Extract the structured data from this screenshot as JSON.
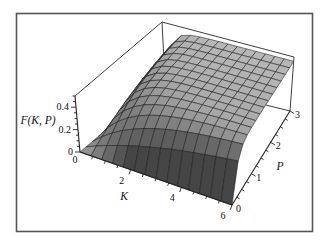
{
  "figure": {
    "background": "#ffffff",
    "frame_color": "#555555"
  },
  "style": {
    "axis_color": "#1f1f1f",
    "box_edge_color": "#3f3f3f",
    "mesh_line_color": "#1a1a1a",
    "label_color": "#111111",
    "surface_gray_light": "#b1b1b1",
    "surface_gray_dark": "#454545"
  },
  "chart_data": {
    "type": "surface3d",
    "title": "",
    "function_label": "F(K, P)",
    "formula": "F(K,P) = 0.46*(1 - exp(-K*P))",
    "k_axis": {
      "label": "K",
      "min": 0,
      "max": 6,
      "major_ticks": [
        2,
        4,
        6
      ],
      "major_tick_labels": [
        "2",
        "4",
        "6"
      ],
      "origin_label": "0",
      "minor_tick_step": 0.5
    },
    "p_axis": {
      "label": "P",
      "min": 0,
      "max": 3,
      "major_ticks": [
        1,
        2,
        3
      ],
      "major_tick_labels": [
        "1",
        "2",
        "3"
      ],
      "origin_label": "0",
      "minor_tick_step": 0.25
    },
    "f_axis": {
      "label": "F(K, P)",
      "min": 0,
      "max": 0.5,
      "major_ticks": [
        0,
        0.2,
        0.4
      ],
      "major_tick_labels": [
        "0",
        "0.2",
        "0.4"
      ],
      "minor_tick_step": 0.05
    },
    "surface": {
      "amplitude": 0.46,
      "grid_points_k": 15,
      "grid_points_p": 15,
      "plateau_value": 0.46
    },
    "sample_values": {
      "k": [
        0,
        1.5,
        3,
        4.5,
        6
      ],
      "p": [
        0,
        1,
        2,
        3
      ],
      "f": [
        [
          0,
          0,
          0,
          0
        ],
        [
          0,
          0.357,
          0.437,
          0.455
        ],
        [
          0,
          0.437,
          0.459,
          0.46
        ],
        [
          0,
          0.455,
          0.46,
          0.46
        ],
        [
          0,
          0.459,
          0.46,
          0.46
        ]
      ]
    },
    "layout": {
      "grid": "mesh-on-surface",
      "legend": "none",
      "boxed": true
    }
  }
}
